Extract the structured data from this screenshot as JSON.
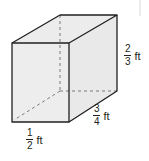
{
  "figure": {
    "type": "rectangular-prism",
    "colors": {
      "face_fill": "#ececec",
      "edge": "#231f20",
      "hidden_edge": "#7a7a7a",
      "background": "#ffffff"
    },
    "dimensions": {
      "height": {
        "numerator": "2",
        "denominator": "3",
        "unit": "ft"
      },
      "depth": {
        "numerator": "3",
        "denominator": "4",
        "unit": "ft"
      },
      "width": {
        "numerator": "1",
        "denominator": "2",
        "unit": "ft"
      }
    }
  }
}
